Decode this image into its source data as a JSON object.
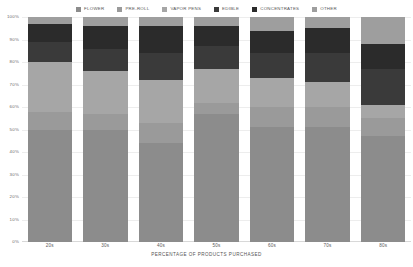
{
  "legend": {
    "items": [
      {
        "label": "FLOWER",
        "color": "#8c8c8c",
        "icon": "legend-swatch-icon"
      },
      {
        "label": "PRE-ROLL",
        "color": "#9a9a9a",
        "icon": "legend-swatch-icon"
      },
      {
        "label": "VAPOR PENS",
        "color": "#a6a6a6",
        "icon": "legend-swatch-icon"
      },
      {
        "label": "EDIBLE",
        "color": "#3a3a3a",
        "icon": "legend-swatch-icon"
      },
      {
        "label": "CONCENTRATES",
        "color": "#2b2b2b",
        "icon": "legend-swatch-icon"
      },
      {
        "label": "OTHER",
        "color": "#9e9e9e",
        "icon": "legend-swatch-icon"
      }
    ]
  },
  "axes": {
    "y_ticks": [
      "100%",
      "90%",
      "80%",
      "70%",
      "60%",
      "50%",
      "40%",
      "30%",
      "20%",
      "10%",
      "0%"
    ],
    "x_ticks": [
      "20s",
      "30s",
      "40s",
      "50s",
      "60s",
      "70s",
      "80s"
    ],
    "x_label": "PERCENTAGE OF PRODUCTS PURCHASED"
  },
  "footnote": "",
  "chart_data": {
    "type": "bar",
    "stacked": true,
    "title": "",
    "subtitle": "",
    "xlabel": "PERCENTAGE OF PRODUCTS PURCHASED",
    "ylabel": "",
    "ylim": [
      0,
      100
    ],
    "y_tick_values": [
      0,
      10,
      20,
      30,
      40,
      50,
      60,
      70,
      80,
      90,
      100
    ],
    "grid": true,
    "legend_position": "top-center",
    "categories": [
      "20s",
      "30s",
      "40s",
      "50s",
      "60s",
      "70s",
      "80s"
    ],
    "series": [
      {
        "name": "FLOWER",
        "color": "#8c8c8c",
        "values": [
          50,
          50,
          44,
          57,
          51,
          51,
          47
        ]
      },
      {
        "name": "PRE-ROLL",
        "color": "#9a9a9a",
        "values": [
          8,
          7,
          9,
          5,
          9,
          9,
          8
        ]
      },
      {
        "name": "VAPOR PENS",
        "color": "#a6a6a6",
        "values": [
          22,
          19,
          19,
          15,
          13,
          11,
          6
        ]
      },
      {
        "name": "EDIBLE",
        "color": "#3a3a3a",
        "values": [
          9,
          10,
          12,
          10,
          11,
          13,
          16
        ]
      },
      {
        "name": "CONCENTRATES",
        "color": "#2b2b2b",
        "values": [
          8,
          10,
          12,
          9,
          10,
          11,
          11
        ]
      },
      {
        "name": "OTHER",
        "color": "#9e9e9e",
        "values": [
          3,
          4,
          4,
          4,
          6,
          5,
          12
        ]
      }
    ]
  }
}
